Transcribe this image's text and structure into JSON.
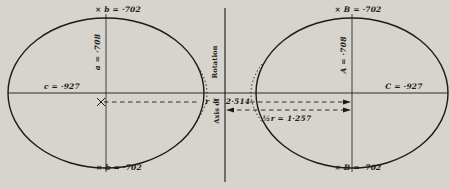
{
  "figure": {
    "background_color": "#d6d4cc",
    "ink_color": "#1d1b17",
    "left_ellipsoid": {
      "top_label": "× b = ·702",
      "vertical_axis_label": "a = ·708",
      "horizontal_axis_label": "c = ·927",
      "bottom_label": "× b = ·702"
    },
    "right_ellipsoid": {
      "top_label": "× B = ·702",
      "vertical_axis_label": "A = ·708",
      "horizontal_axis_label": "C = ·927",
      "bottom_label": "× B = ·702"
    },
    "rotation_axis": {
      "label_upper": "Rotation",
      "label_lower": "Axis of"
    },
    "distances": {
      "r_label": "r =",
      "r_value": "2·514",
      "half_r_label": "½r = 1·257"
    }
  }
}
